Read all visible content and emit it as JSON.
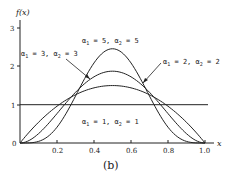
{
  "chart_data": {
    "type": "line",
    "title": "",
    "caption": "(b)",
    "xlabel": "x",
    "ylabel": "f(x)",
    "xlim": [
      0,
      1.0
    ],
    "ylim": [
      0,
      3
    ],
    "x_ticks": [
      "0.2",
      "0.4",
      "0.6",
      "0.8",
      "1.0"
    ],
    "y_ticks": [
      "0",
      "1",
      "2",
      "3"
    ],
    "origin_label": "0",
    "grid": false,
    "series": [
      {
        "name": "α1 = 1, α2 = 1",
        "a": 1,
        "b": 1,
        "peak": 1.0
      },
      {
        "name": "α1 = 2, α2 = 2",
        "a": 2,
        "b": 2,
        "peak": 1.5
      },
      {
        "name": "α1 = 3, α2 = 3",
        "a": 3,
        "b": 3,
        "peak": 1.875
      },
      {
        "name": "α1 = 5, α2 = 5",
        "a": 5,
        "b": 5,
        "peak": 2.461
      }
    ],
    "annotations": [
      {
        "text_a": "α",
        "sub1": "1",
        "mid": " = 5,  α",
        "sub2": "2",
        "end": " = 5"
      },
      {
        "text_a": "α",
        "sub1": "1",
        "mid": " = 3,  α",
        "sub2": "2",
        "end": " = 3"
      },
      {
        "text_a": "α",
        "sub1": "1",
        "mid": " = 2,  α",
        "sub2": "2",
        "end": " = 2"
      },
      {
        "text_a": "α",
        "sub1": "1",
        "mid": " = 1,  α",
        "sub2": "2",
        "end": " = 1"
      }
    ]
  },
  "colors": {
    "line": "#222222",
    "background": "#ffffff"
  }
}
